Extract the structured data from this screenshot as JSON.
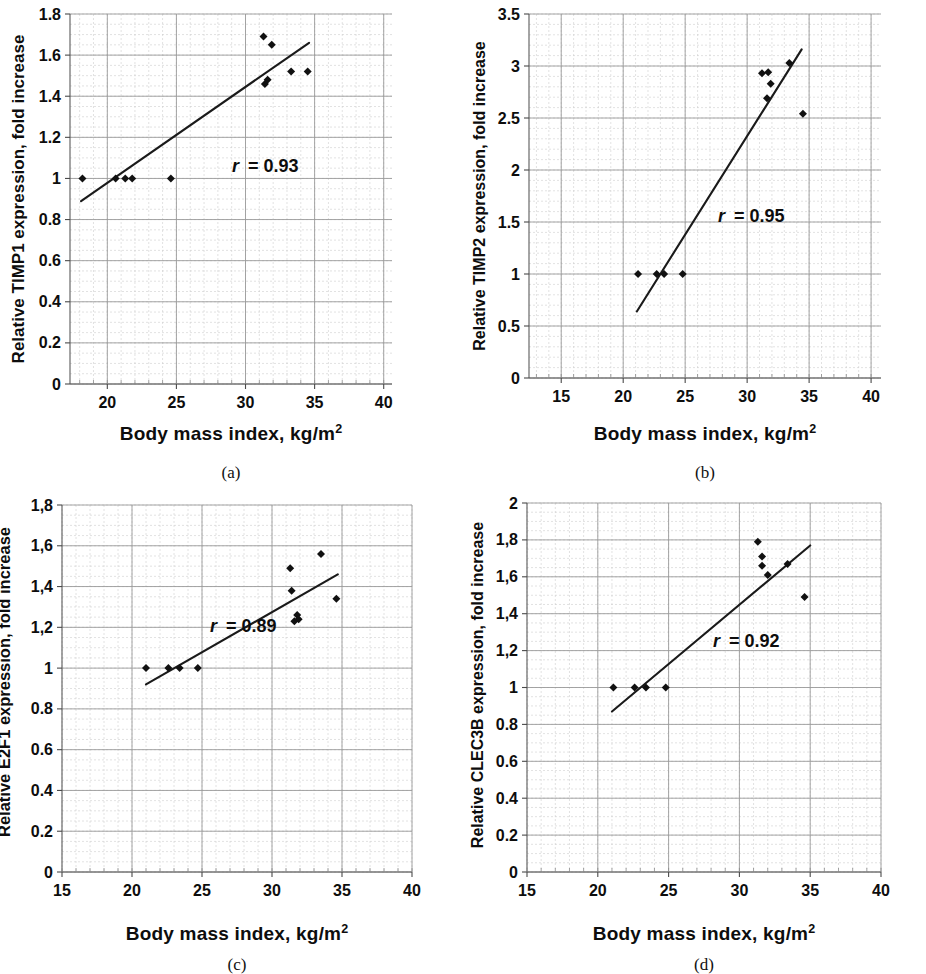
{
  "figure": {
    "panel_count": 4,
    "shared_xlabel": "Body mass index,  kg/m",
    "shared_xlabel_sup": "2"
  },
  "panels": [
    {
      "id": "a",
      "caption": "(a)",
      "ylabel": "Relative TIMP1 expression, fold increase",
      "xlabel": "Body mass index,  kg/m",
      "xlabel_sup": "2",
      "r_symbol": "r",
      "r_text": "= 0.93"
    },
    {
      "id": "b",
      "caption": "(b)",
      "ylabel": "Relative TIMP2 expression, fold increase",
      "xlabel": "Body mass index,  kg/m",
      "xlabel_sup": "2",
      "r_symbol": "r",
      "r_text": "= 0.95"
    },
    {
      "id": "c",
      "caption": "(c)",
      "ylabel": "Relative E2F1 expression, fold increase",
      "xlabel": "Body mass index,  kg/m",
      "xlabel_sup": "2",
      "r_symbol": "r",
      "r_text": "= 0.89"
    },
    {
      "id": "d",
      "caption": "(d)",
      "ylabel": "Relative CLEC3B expression, fold increase",
      "xlabel": "Body mass index,  kg/m",
      "xlabel_sup": "2",
      "r_symbol": "r",
      "r_text": "= 0.92"
    }
  ],
  "chart_data": [
    {
      "panel": "a",
      "type": "scatter",
      "title": "",
      "xlabel": "Body mass index, kg/m2",
      "ylabel": "Relative TIMP1 expression, fold increase",
      "xlim": [
        17.3,
        40.6
      ],
      "ylim": [
        0,
        1.8
      ],
      "xticks": [
        20,
        25,
        30,
        35,
        40
      ],
      "xticklabels": [
        "20",
        "25",
        "30",
        "35",
        "40"
      ],
      "yticks": [
        0,
        0.2,
        0.4,
        0.6,
        0.8,
        1,
        1.2,
        1.4,
        1.6,
        1.8
      ],
      "yticklabels": [
        "0",
        "0.2",
        "0.4",
        "0.6",
        "0.8",
        "1",
        "1.2",
        "1.4",
        "1.6",
        "1.8"
      ],
      "grid": true,
      "minor_grid": true,
      "annotation": "r = 0.93",
      "correlation_r": 0.93,
      "x": [
        18.2,
        20.6,
        21.3,
        21.8,
        24.6,
        31.3,
        31.4,
        31.6,
        31.9,
        33.3,
        34.5
      ],
      "y": [
        1.0,
        1.0,
        1.0,
        1.0,
        1.0,
        1.69,
        1.46,
        1.48,
        1.65,
        1.52,
        1.52
      ],
      "trendline": {
        "x": [
          18.1,
          34.6
        ],
        "y": [
          0.89,
          1.66
        ]
      }
    },
    {
      "panel": "b",
      "type": "scatter",
      "title": "",
      "xlabel": "Body mass index, kg/m2",
      "ylabel": "Relative TIMP2 expression, fold increase",
      "xlim": [
        12.4,
        40.8
      ],
      "ylim": [
        0,
        3.5
      ],
      "xticks": [
        15,
        20,
        25,
        30,
        35,
        40
      ],
      "xticklabels": [
        "15",
        "20",
        "25",
        "30",
        "35",
        "40"
      ],
      "yticks": [
        0,
        0.5,
        1,
        1.5,
        2,
        2.5,
        3,
        3.5
      ],
      "yticklabels": [
        "0",
        "0.5",
        "1",
        "1.5",
        "2",
        "2.5",
        "3",
        "3.5"
      ],
      "grid": true,
      "minor_grid": true,
      "annotation": "r = 0.95",
      "correlation_r": 0.95,
      "x": [
        21.2,
        22.7,
        23.3,
        24.8,
        31.2,
        31.7,
        31.9,
        31.6,
        33.4,
        34.5
      ],
      "y": [
        1.0,
        1.0,
        1.0,
        1.0,
        2.93,
        2.94,
        2.83,
        2.69,
        3.03,
        2.54
      ],
      "trendline": {
        "x": [
          21.1,
          34.4
        ],
        "y": [
          0.64,
          3.16
        ]
      }
    },
    {
      "panel": "c",
      "type": "scatter",
      "title": "",
      "xlabel": "Body mass index, kg/m2",
      "ylabel": "Relative E2F1 expression, fold increase",
      "xlim": [
        15,
        40
      ],
      "ylim": [
        0,
        1.8
      ],
      "xticks": [
        15,
        20,
        25,
        30,
        35,
        40
      ],
      "xticklabels": [
        "15",
        "20",
        "25",
        "30",
        "35",
        "40"
      ],
      "yticks": [
        0,
        0.2,
        0.4,
        0.6,
        0.8,
        1,
        1.2,
        1.4,
        1.6,
        1.8
      ],
      "yticklabels": [
        "0",
        "0.2",
        "0.4",
        "0.6",
        "0.8",
        "1",
        "1,2",
        "1,4",
        "1,6",
        "1,8"
      ],
      "grid": true,
      "minor_grid": true,
      "annotation": "r = 0.89",
      "correlation_r": 0.89,
      "x": [
        21.0,
        22.6,
        23.4,
        24.7,
        31.3,
        31.4,
        31.6,
        31.8,
        31.9,
        33.5,
        34.6
      ],
      "y": [
        1.0,
        1.0,
        1.0,
        1.0,
        1.49,
        1.38,
        1.23,
        1.26,
        1.24,
        1.56,
        1.34
      ],
      "trendline": {
        "x": [
          21.0,
          34.7
        ],
        "y": [
          0.92,
          1.46
        ]
      }
    },
    {
      "panel": "d",
      "type": "scatter",
      "title": "",
      "xlabel": "Body mass index, kg/m2",
      "ylabel": "Relative CLEC3B expression, fold increase",
      "xlim": [
        15,
        40
      ],
      "ylim": [
        0,
        2
      ],
      "xticks": [
        15,
        20,
        25,
        30,
        35,
        40
      ],
      "xticklabels": [
        "15",
        "20",
        "25",
        "30",
        "35",
        "40"
      ],
      "yticks": [
        0,
        0.2,
        0.4,
        0.6,
        0.8,
        1,
        1.2,
        1.4,
        1.6,
        1.8,
        2
      ],
      "yticklabels": [
        "0",
        "0.2",
        "0.4",
        "0.6",
        "0.8",
        "1",
        "1,2",
        "1,4",
        "1,6",
        "1,8",
        "2"
      ],
      "grid": true,
      "minor_grid": true,
      "annotation": "r = 0.92",
      "correlation_r": 0.92,
      "x": [
        21.1,
        22.6,
        23.4,
        24.8,
        31.3,
        31.6,
        31.6,
        32.0,
        33.4,
        34.6
      ],
      "y": [
        1.0,
        1.0,
        1.0,
        1.0,
        1.79,
        1.71,
        1.66,
        1.61,
        1.67,
        1.49
      ],
      "trendline": {
        "x": [
          21.0,
          35.0
        ],
        "y": [
          0.87,
          1.77
        ]
      }
    }
  ],
  "colors": {
    "marker": "#111111",
    "trendline": "#1a1a1a",
    "grid_major": "#9a9a9a",
    "grid_minor": "#c9c9c9",
    "axis": "#5a5a5a",
    "text": "#0d0d0d",
    "background": "#ffffff"
  }
}
